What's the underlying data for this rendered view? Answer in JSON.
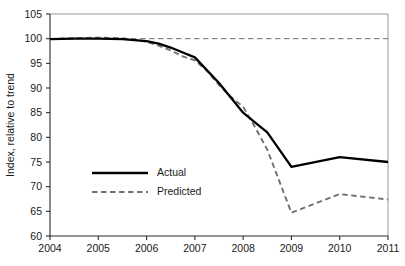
{
  "chart_data": {
    "type": "line",
    "title": "",
    "subtitle": "",
    "xlabel": "",
    "ylabel": "Index, relative to trend",
    "xlim": [
      2004,
      2011
    ],
    "ylim": [
      60,
      105
    ],
    "ytick_step": 5,
    "grid": false,
    "legend_position": "inside-left-lower",
    "categories": [
      2004,
      2005,
      2006,
      2007,
      2008,
      2009,
      2010,
      2011
    ],
    "x_tick_labels": [
      "2004",
      "2005",
      "2006",
      "2007",
      "2008",
      "2009",
      "2010",
      "2011"
    ],
    "y_tick_labels": [
      "60",
      "65",
      "70",
      "75",
      "80",
      "85",
      "90",
      "95",
      "100",
      "105"
    ],
    "y_tick_values": [
      60,
      65,
      70,
      75,
      80,
      85,
      90,
      95,
      100,
      105
    ],
    "reference_line": {
      "value": 100,
      "style": "dashed",
      "color": "#707070",
      "label": ""
    },
    "series": [
      {
        "name": "Actual",
        "style": "solid",
        "color": "#000000",
        "x": [
          2004,
          2004.5,
          2005,
          2005.5,
          2006,
          2006.25,
          2006.5,
          2006.75,
          2007,
          2007.5,
          2008,
          2008.25,
          2008.5,
          2009,
          2010,
          2011
        ],
        "values": [
          99.9,
          100.0,
          100.0,
          99.9,
          99.5,
          99.0,
          98.2,
          97.2,
          96.2,
          91.0,
          85.0,
          83.0,
          81.0,
          74.0,
          76.0,
          75.0
        ]
      },
      {
        "name": "Predicted",
        "style": "dashed",
        "color": "#707070",
        "x": [
          2004,
          2004.5,
          2005,
          2005.5,
          2006,
          2006.25,
          2006.5,
          2006.75,
          2007,
          2007.25,
          2007.5,
          2007.75,
          2008,
          2008.25,
          2008.5,
          2009,
          2010,
          2011
        ],
        "values": [
          99.9,
          100.1,
          100.2,
          100.1,
          99.4,
          98.6,
          97.6,
          96.4,
          95.6,
          93.5,
          90.6,
          88.2,
          86.2,
          82.0,
          77.5,
          64.7,
          68.5,
          67.4
        ]
      }
    ],
    "legend": [
      {
        "label": "Actual",
        "style": "solid",
        "color": "#000000"
      },
      {
        "label": "Predicted",
        "style": "dashed",
        "color": "#707070"
      }
    ]
  },
  "geometry": {
    "plot_left": 50,
    "plot_right": 388,
    "plot_top": 14,
    "plot_bottom": 236,
    "legend_x": 92,
    "legend_sample_width": 56,
    "legend_row1_y": 173,
    "legend_row2_y": 192,
    "ylabel_x": 14,
    "ylabel_y": 125
  }
}
